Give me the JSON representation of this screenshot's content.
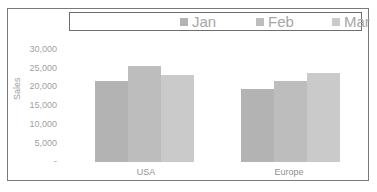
{
  "chart_data": {
    "type": "bar",
    "title": "",
    "xlabel": "",
    "ylabel": "Sales",
    "categories": [
      "USA",
      "Europe"
    ],
    "series": [
      {
        "name": "Jan",
        "color": "#b3b3b3",
        "values": [
          21500,
          19500
        ]
      },
      {
        "name": "Feb",
        "color": "#bdbdbd",
        "values": [
          25500,
          21500
        ]
      },
      {
        "name": "Mar",
        "color": "#cacaca",
        "values": [
          23000,
          23500
        ]
      }
    ],
    "ylim": [
      0,
      30000
    ],
    "yticks": [
      "-",
      "5,000",
      "10,000",
      "15,000",
      "20,000",
      "25,000",
      "30,000"
    ],
    "grid": false,
    "legend_position": "top"
  },
  "legend": {
    "items": [
      {
        "label": "Jan"
      },
      {
        "label": "Feb"
      },
      {
        "label": "Mar"
      }
    ]
  },
  "axis": {
    "ylabel": "Sales",
    "yticks": [
      "-",
      "5,000",
      "10,000",
      "15,000",
      "20,000",
      "25,000",
      "30,000"
    ],
    "xlabels": [
      "USA",
      "Europe"
    ]
  }
}
